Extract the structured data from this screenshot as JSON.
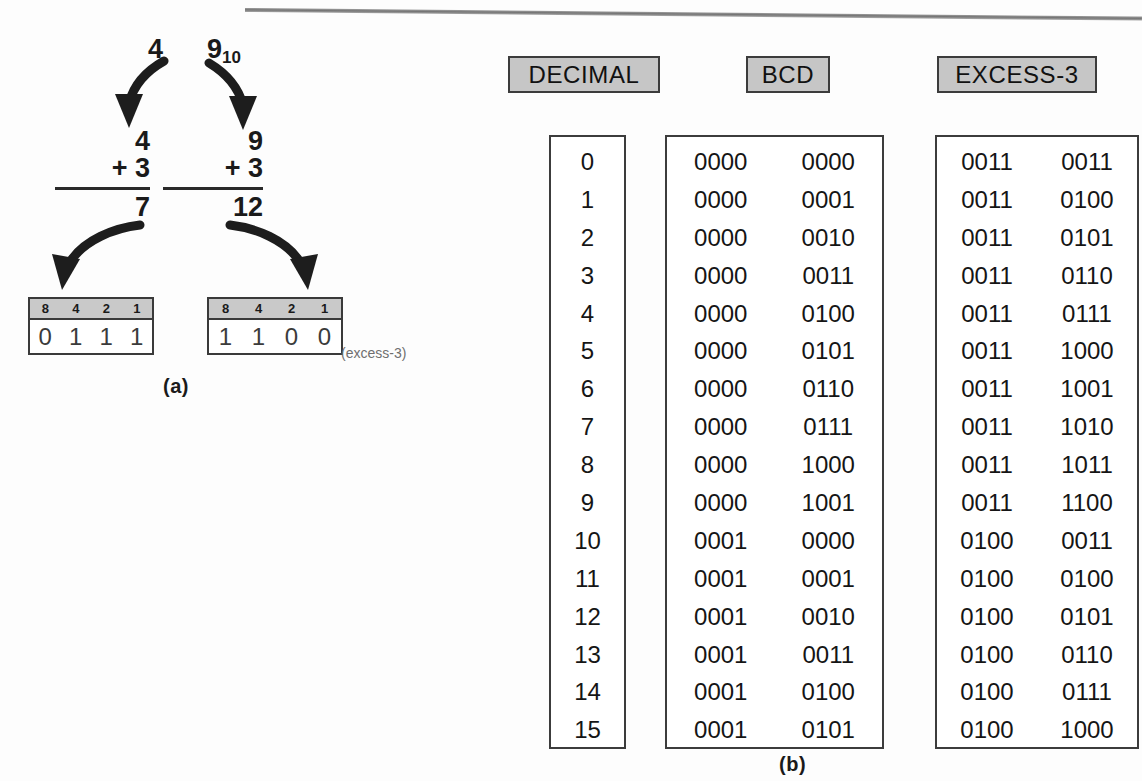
{
  "figure": {
    "part_a": {
      "label": "(a)",
      "conversions": [
        {
          "source_value": "4",
          "source_subscript": "",
          "addend_top": "4",
          "addend_bottom": "+ 3",
          "sum": "7",
          "weights": [
            "8",
            "4",
            "2",
            "1"
          ],
          "bits": [
            "0",
            "1",
            "1",
            "1"
          ],
          "note": ""
        },
        {
          "source_value": "9",
          "source_subscript": "10",
          "addend_top": "9",
          "addend_bottom": "+ 3",
          "sum": "12",
          "weights": [
            "8",
            "4",
            "2",
            "1"
          ],
          "bits": [
            "1",
            "1",
            "0",
            "0"
          ],
          "note": "(excess-3)"
        }
      ]
    },
    "part_b": {
      "label": "(b)",
      "headers": [
        "DECIMAL",
        "BCD",
        "EXCESS-3"
      ],
      "rows": [
        {
          "decimal": "0",
          "bcd": [
            "0000",
            "0000"
          ],
          "excess3": [
            "0011",
            "0011"
          ]
        },
        {
          "decimal": "1",
          "bcd": [
            "0000",
            "0001"
          ],
          "excess3": [
            "0011",
            "0100"
          ]
        },
        {
          "decimal": "2",
          "bcd": [
            "0000",
            "0010"
          ],
          "excess3": [
            "0011",
            "0101"
          ]
        },
        {
          "decimal": "3",
          "bcd": [
            "0000",
            "0011"
          ],
          "excess3": [
            "0011",
            "0110"
          ]
        },
        {
          "decimal": "4",
          "bcd": [
            "0000",
            "0100"
          ],
          "excess3": [
            "0011",
            "0111"
          ]
        },
        {
          "decimal": "5",
          "bcd": [
            "0000",
            "0101"
          ],
          "excess3": [
            "0011",
            "1000"
          ]
        },
        {
          "decimal": "6",
          "bcd": [
            "0000",
            "0110"
          ],
          "excess3": [
            "0011",
            "1001"
          ]
        },
        {
          "decimal": "7",
          "bcd": [
            "0000",
            "0111"
          ],
          "excess3": [
            "0011",
            "1010"
          ]
        },
        {
          "decimal": "8",
          "bcd": [
            "0000",
            "1000"
          ],
          "excess3": [
            "0011",
            "1011"
          ]
        },
        {
          "decimal": "9",
          "bcd": [
            "0000",
            "1001"
          ],
          "excess3": [
            "0011",
            "1100"
          ]
        },
        {
          "decimal": "10",
          "bcd": [
            "0001",
            "0000"
          ],
          "excess3": [
            "0100",
            "0011"
          ]
        },
        {
          "decimal": "11",
          "bcd": [
            "0001",
            "0001"
          ],
          "excess3": [
            "0100",
            "0100"
          ]
        },
        {
          "decimal": "12",
          "bcd": [
            "0001",
            "0010"
          ],
          "excess3": [
            "0100",
            "0101"
          ]
        },
        {
          "decimal": "13",
          "bcd": [
            "0001",
            "0011"
          ],
          "excess3": [
            "0100",
            "0110"
          ]
        },
        {
          "decimal": "14",
          "bcd": [
            "0001",
            "0100"
          ],
          "excess3": [
            "0100",
            "0111"
          ]
        },
        {
          "decimal": "15",
          "bcd": [
            "0001",
            "0101"
          ],
          "excess3": [
            "0100",
            "1000"
          ]
        }
      ]
    }
  },
  "colors": {
    "header_fill": "#c6c6c6",
    "weight_fill": "#c9c9c9",
    "border": "#3c3c3c",
    "text": "#151515",
    "note_text": "#6f6f6f"
  }
}
